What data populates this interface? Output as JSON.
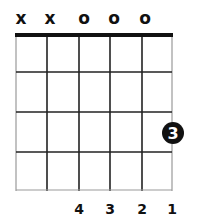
{
  "chord_diagram": {
    "strings": 6,
    "frets_shown": 4,
    "string_markers": [
      "x",
      "x",
      "o",
      "o",
      "o",
      ""
    ],
    "finger_numbers": [
      "",
      "",
      "4",
      "3",
      "2",
      "1"
    ],
    "fret_position_label": "3",
    "colors": {
      "line": "#222222",
      "outer_line": "#999999",
      "nut": "#111111",
      "dot": "#111111",
      "dot_text": "#ffffff",
      "background": "#ffffff"
    }
  }
}
